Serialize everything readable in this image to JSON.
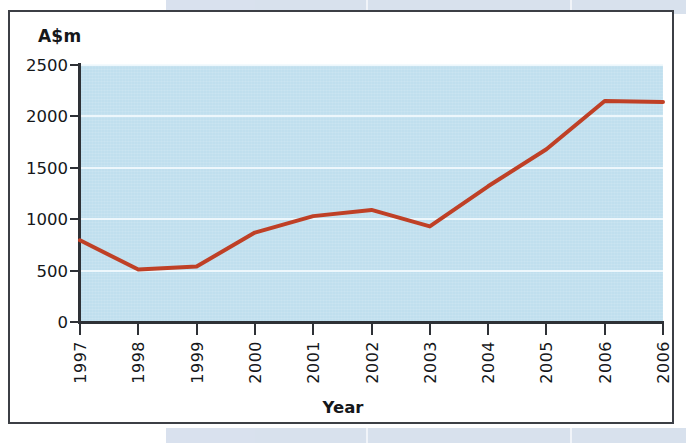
{
  "figure": {
    "y_axis_unit": "A$m",
    "x_axis_title": "Year"
  },
  "colors": {
    "plot_background": "#c0dfee",
    "gridline": "#f2fafd",
    "series_line": "#bf4026",
    "axis": "#2e3136",
    "frame_border": "#3c3f45",
    "text": "#15171a",
    "scan_artifact": "#ccd7e8"
  },
  "chart_data": {
    "type": "line",
    "title": "",
    "subtitle": "",
    "xlabel": "Year",
    "ylabel": "A$m",
    "categories": [
      "1997",
      "1998",
      "1999",
      "2000",
      "2001",
      "2002",
      "2003",
      "2004",
      "2005",
      "2006",
      "2006"
    ],
    "values": [
      795,
      510,
      540,
      870,
      1030,
      1090,
      930,
      1320,
      1680,
      2150,
      2140
    ],
    "series": [
      {
        "name": "A$m",
        "color": "#bf4026",
        "values": [
          795,
          510,
          540,
          870,
          1030,
          1090,
          930,
          1320,
          1680,
          2150,
          2140
        ]
      }
    ],
    "ylim": [
      0,
      2500
    ],
    "yticks": [
      0,
      500,
      1000,
      1500,
      2000,
      2500
    ],
    "ytick_labels": [
      "0",
      "500",
      "1000",
      "1500",
      "2000",
      "2500"
    ],
    "xtick_labels": [
      "1997",
      "1998",
      "1999",
      "2000",
      "2001",
      "2002",
      "2003",
      "2004",
      "2005",
      "2006",
      "2006"
    ],
    "grid": true,
    "grid_axis": "y",
    "legend": false,
    "legend_position": "none",
    "markers": false,
    "annotations": []
  }
}
